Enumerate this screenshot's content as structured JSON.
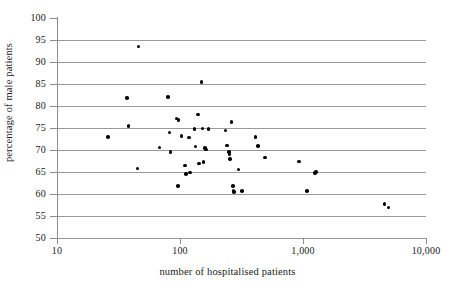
{
  "chart_data": {
    "type": "scatter",
    "title": "",
    "xlabel": "number of hospitalised patients",
    "ylabel": "percentage of male patients",
    "x_scale": "log",
    "y_scale": "linear",
    "xlim": [
      10,
      10000
    ],
    "ylim": [
      50,
      100
    ],
    "grid": "horizontal",
    "legend": "none",
    "x_tick_labels": [
      "10",
      "100",
      "1,000",
      "10,000"
    ],
    "x_tick_values": [
      10,
      100,
      1000,
      10000
    ],
    "y_tick_labels": [
      "50",
      "55",
      "60",
      "65",
      "70",
      "75",
      "80",
      "85",
      "90",
      "95",
      "100"
    ],
    "y_tick_values": [
      50,
      55,
      60,
      65,
      70,
      75,
      80,
      85,
      90,
      95,
      100
    ],
    "marker": "filled-circle",
    "marker_color": "#000000",
    "gridline_color": "#9a9a9a",
    "axis_color": "#8c8c8c",
    "points": [
      {
        "x": 26,
        "y": 73.0
      },
      {
        "x": 38,
        "y": 75.5
      },
      {
        "x": 37,
        "y": 81.8
      },
      {
        "x": 46,
        "y": 93.5
      },
      {
        "x": 45,
        "y": 65.8
      },
      {
        "x": 68,
        "y": 70.6
      },
      {
        "x": 80,
        "y": 82.0
      },
      {
        "x": 82,
        "y": 74.0
      },
      {
        "x": 84,
        "y": 69.5
      },
      {
        "x": 94,
        "y": 77.2
      },
      {
        "x": 97,
        "y": 76.8
      },
      {
        "x": 96,
        "y": 61.8
      },
      {
        "x": 103,
        "y": 73.2
      },
      {
        "x": 110,
        "y": 66.5
      },
      {
        "x": 112,
        "y": 64.6
      },
      {
        "x": 118,
        "y": 72.8
      },
      {
        "x": 120,
        "y": 64.9
      },
      {
        "x": 131,
        "y": 74.8
      },
      {
        "x": 134,
        "y": 70.8
      },
      {
        "x": 140,
        "y": 78.1
      },
      {
        "x": 143,
        "y": 66.9
      },
      {
        "x": 150,
        "y": 85.5
      },
      {
        "x": 152,
        "y": 74.9
      },
      {
        "x": 155,
        "y": 67.3
      },
      {
        "x": 160,
        "y": 70.4
      },
      {
        "x": 162,
        "y": 70.1
      },
      {
        "x": 170,
        "y": 74.8
      },
      {
        "x": 235,
        "y": 74.4
      },
      {
        "x": 240,
        "y": 71.0
      },
      {
        "x": 250,
        "y": 69.5
      },
      {
        "x": 252,
        "y": 69.0
      },
      {
        "x": 255,
        "y": 68.0
      },
      {
        "x": 262,
        "y": 76.4
      },
      {
        "x": 270,
        "y": 61.8
      },
      {
        "x": 272,
        "y": 60.8
      },
      {
        "x": 275,
        "y": 60.4
      },
      {
        "x": 300,
        "y": 65.6
      },
      {
        "x": 320,
        "y": 60.7
      },
      {
        "x": 410,
        "y": 73.0
      },
      {
        "x": 430,
        "y": 70.9
      },
      {
        "x": 490,
        "y": 68.3
      },
      {
        "x": 930,
        "y": 67.4
      },
      {
        "x": 1080,
        "y": 60.7
      },
      {
        "x": 1250,
        "y": 64.8
      },
      {
        "x": 1280,
        "y": 65.0
      },
      {
        "x": 4600,
        "y": 57.7
      },
      {
        "x": 4950,
        "y": 56.9
      }
    ]
  }
}
